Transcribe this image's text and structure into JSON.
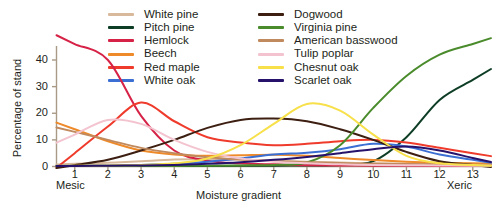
{
  "chart_data": {
    "type": "line",
    "title": "",
    "xlabel": "Moisture gradient",
    "ylabel": "Percentage of stand",
    "xlim": [
      0.45,
      13.55
    ],
    "ylim": [
      0,
      48
    ],
    "grid": false,
    "legend_position": "top-center",
    "x_tick_labels": [
      "1",
      "2",
      "3",
      "4",
      "5",
      "6",
      "7",
      "8",
      "9",
      "10",
      "11",
      "12",
      "13"
    ],
    "y_tick_labels": [
      "0",
      "10",
      "20",
      "30",
      "40"
    ],
    "x_end_labels": {
      "left": "Mesic",
      "right": "Xeric"
    },
    "x": [
      1,
      2,
      3,
      4,
      5,
      6,
      7,
      8,
      9,
      10,
      11,
      12,
      13
    ],
    "series": [
      {
        "name": "White pine",
        "color": "#d9b99b",
        "values": [
          1.0,
          1.4,
          2.0,
          2.6,
          2.8,
          2.6,
          2.2,
          1.8,
          1.5,
          1.2,
          1.0,
          0.9,
          0.8
        ]
      },
      {
        "name": "Pitch pine",
        "color": "#0e3d25",
        "values": [
          0.2,
          0.2,
          0.2,
          0.2,
          0.2,
          0.3,
          0.3,
          0.4,
          0.6,
          2.0,
          11.0,
          25.0,
          32.5
        ]
      },
      {
        "name": "Hemlock",
        "color": "#d62246",
        "values": [
          46.0,
          40.0,
          19.0,
          6.0,
          2.2,
          1.2,
          0.8,
          0.5,
          0.4,
          0.3,
          0.3,
          0.2,
          0.2
        ]
      },
      {
        "name": "Beech",
        "color": "#ee8a2a",
        "values": [
          14.0,
          9.5,
          6.0,
          4.5,
          4.0,
          4.2,
          4.4,
          4.0,
          3.2,
          2.4,
          1.8,
          1.4,
          1.2
        ]
      },
      {
        "name": "Red maple",
        "color": "#ef3b2c",
        "values": [
          5.0,
          15.0,
          24.0,
          17.0,
          11.0,
          9.0,
          8.0,
          8.5,
          9.5,
          10.0,
          9.0,
          7.0,
          5.0
        ]
      },
      {
        "name": "White oak",
        "color": "#3b6fd4",
        "values": [
          0.3,
          0.4,
          0.6,
          1.0,
          1.8,
          3.0,
          4.5,
          5.2,
          6.5,
          8.5,
          7.5,
          4.5,
          2.5
        ]
      },
      {
        "name": "Dogwood",
        "color": "#3d1f12",
        "values": [
          0.5,
          2.5,
          6.0,
          10.0,
          14.5,
          17.5,
          18.0,
          17.0,
          14.0,
          10.0,
          5.5,
          2.0,
          0.6
        ]
      },
      {
        "name": "Virginia pine",
        "color": "#4a8b2c",
        "values": [
          0.2,
          0.2,
          0.2,
          0.2,
          0.3,
          0.4,
          0.6,
          1.5,
          8.0,
          22.0,
          34.0,
          42.0,
          46.0
        ]
      },
      {
        "name": "American basswood",
        "color": "#c08a5e",
        "values": [
          13.0,
          10.0,
          7.0,
          5.0,
          3.5,
          2.6,
          2.0,
          1.6,
          1.3,
          1.0,
          0.9,
          0.8,
          0.7
        ]
      },
      {
        "name": "Tulip poplar",
        "color": "#f3c4cf",
        "values": [
          12.0,
          17.5,
          16.0,
          10.0,
          5.5,
          3.0,
          1.8,
          1.2,
          0.8,
          0.6,
          0.5,
          0.4,
          0.3
        ]
      },
      {
        "name": "Chesnut oak",
        "color": "#f7e04a",
        "values": [
          0.3,
          0.4,
          0.6,
          1.2,
          3.0,
          8.0,
          16.0,
          23.5,
          21.0,
          12.0,
          4.0,
          1.2,
          0.6
        ]
      },
      {
        "name": "Scarlet oak",
        "color": "#26116b",
        "values": [
          0.2,
          0.3,
          0.4,
          0.6,
          1.0,
          1.6,
          2.5,
          3.6,
          5.0,
          6.5,
          7.5,
          6.0,
          3.2
        ]
      }
    ]
  },
  "legend": {
    "entries": [
      {
        "label": "White pine"
      },
      {
        "label": "Dogwood"
      },
      {
        "label": "Pitch pine"
      },
      {
        "label": "Virginia pine"
      },
      {
        "label": "Hemlock"
      },
      {
        "label": "American basswood"
      },
      {
        "label": "Beech"
      },
      {
        "label": "Tulip poplar"
      },
      {
        "label": "Red maple"
      },
      {
        "label": "Chesnut oak"
      },
      {
        "label": "White oak"
      },
      {
        "label": "Scarlet oak"
      }
    ]
  },
  "axes": {
    "ylabel": "Percentage of stand",
    "xlabel": "Moisture gradient",
    "mesic": "Mesic",
    "xeric": "Xeric"
  },
  "colors": {
    "axis": "#a89a86",
    "text": "#231f20"
  }
}
